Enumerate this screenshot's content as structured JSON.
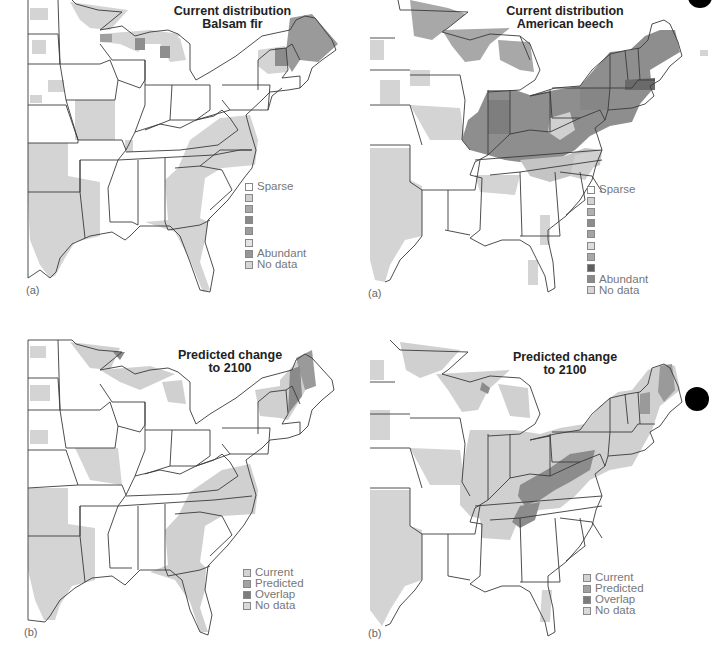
{
  "figure": {
    "panels": [
      {
        "id": "balsam-current",
        "title_line1": "Current distribution",
        "title_line2": "Balsam fir",
        "panel_label": "(a)",
        "legend": [
          {
            "label": "Sparse",
            "color": "#ffffff"
          },
          {
            "label": "",
            "color": "#cfcfcf"
          },
          {
            "label": "",
            "color": "#a9a9a9"
          },
          {
            "label": "",
            "color": "#8a8a8a"
          },
          {
            "label": "",
            "color": "#9c9c9c"
          },
          {
            "label": "",
            "color": "#e4e4e4"
          },
          {
            "label": "Abundant",
            "color": "#969696"
          },
          {
            "label": "No data",
            "color": "#d6d6d6"
          }
        ]
      },
      {
        "id": "beech-current",
        "title_line1": "Current distribution",
        "title_line2": "American beech",
        "panel_label": "(a)",
        "legend": [
          {
            "label": "Sparse",
            "color": "#ffffff"
          },
          {
            "label": "",
            "color": "#d2d2d2"
          },
          {
            "label": "",
            "color": "#b0b0b0"
          },
          {
            "label": "",
            "color": "#8c8c8c"
          },
          {
            "label": "",
            "color": "#a3a3a3"
          },
          {
            "label": "",
            "color": "#dddddd"
          },
          {
            "label": "",
            "color": "#a8a8a8"
          },
          {
            "label": "",
            "color": "#5e5e5e"
          },
          {
            "label": "Abundant",
            "color": "#8a8a8a"
          },
          {
            "label": "No data",
            "color": "#d6d6d6"
          }
        ]
      },
      {
        "id": "balsam-predicted",
        "title_line1": "Predicted change",
        "title_line2": "to 2100",
        "panel_label": "(b)",
        "legend": [
          {
            "label": "Current",
            "color": "#d3d3d3"
          },
          {
            "label": "Predicted",
            "color": "#a2a2a2"
          },
          {
            "label": "Overlap",
            "color": "#7c7c7c"
          },
          {
            "label": "No data",
            "color": "#d9d9d9"
          }
        ]
      },
      {
        "id": "beech-predicted",
        "title_line1": "Predicted change",
        "title_line2": "to 2100",
        "panel_label": "(b)",
        "legend": [
          {
            "label": "Current",
            "color": "#d3d3d3"
          },
          {
            "label": "Predicted",
            "color": "#a2a2a2"
          },
          {
            "label": "Overlap",
            "color": "#7c7c7c"
          },
          {
            "label": "No data",
            "color": "#d9d9d9"
          }
        ]
      }
    ],
    "colors": {
      "nodata": "#d4d4d4",
      "current_light": "#d0d0d0",
      "mid": "#a8a8a8",
      "dark": "#8e8e8e",
      "darkest": "#6e6e6e",
      "border": "#3a3a3a",
      "marker": "#000000"
    }
  }
}
